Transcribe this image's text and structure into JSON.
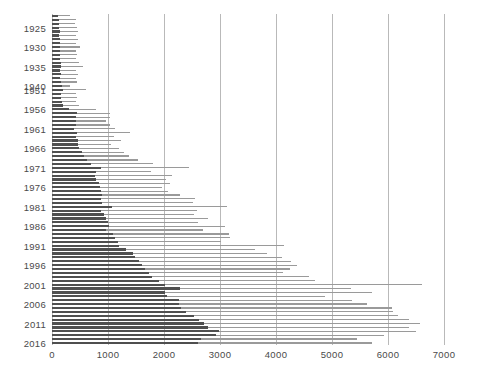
{
  "chart_data": {
    "type": "bar",
    "orientation": "horizontal",
    "title": "",
    "subtitle": "",
    "xlabel": "",
    "ylabel": "",
    "xlim": [
      0,
      7000
    ],
    "ylim_categories": "years 1922-2016 (war years 1941-1950 omitted)",
    "xticks": [
      0,
      1000,
      2000,
      3000,
      4000,
      5000,
      6000,
      7000
    ],
    "xtick_labels": [
      "0",
      "1000",
      "2000",
      "3000",
      "4000",
      "5000",
      "6000",
      "7000"
    ],
    "ytick_labels": [
      "1925",
      "1930",
      "1935",
      "1940",
      "1951",
      "1956",
      "1961",
      "1966",
      "1971",
      "1976",
      "1981",
      "1986",
      "1991",
      "1996",
      "2001",
      "2006",
      "2011",
      "2016"
    ],
    "grid": "vertical-only",
    "legend": "none",
    "colors": {
      "dark_series": "#4f4f4f",
      "light_series": "#9a9a9a",
      "gridline": "#b9b9b9",
      "label_text": "#4a4a4a",
      "background": "#ffffff"
    },
    "series": [
      {
        "name": "dark",
        "color": "#4f4f4f"
      },
      {
        "name": "light",
        "color": "#9a9a9a"
      }
    ],
    "categories": [
      "1922",
      "1923",
      "1924",
      "1925",
      "1926",
      "1927",
      "1928",
      "1929",
      "1930",
      "1931",
      "1932",
      "1933",
      "1934",
      "1935",
      "1936",
      "1937",
      "1938",
      "1939",
      "1940",
      "1951",
      "1952",
      "1953",
      "1954",
      "1955",
      "1956",
      "1957",
      "1958",
      "1959",
      "1960",
      "1961",
      "1962",
      "1963",
      "1964",
      "1965",
      "1966",
      "1967",
      "1968",
      "1969",
      "1970",
      "1971",
      "1972",
      "1973",
      "1974",
      "1975",
      "1976",
      "1977",
      "1978",
      "1979",
      "1980",
      "1981",
      "1982",
      "1983",
      "1984",
      "1985",
      "1986",
      "1987",
      "1988",
      "1989",
      "1990",
      "1991",
      "1992",
      "1993",
      "1994",
      "1995",
      "1996",
      "1997",
      "1998",
      "1999",
      "2000",
      "2001",
      "2002",
      "2003",
      "2004",
      "2005",
      "2006",
      "2007",
      "2008",
      "2009",
      "2010",
      "2011",
      "2012",
      "2013",
      "2014",
      "2015",
      "2016"
    ],
    "rows": [
      {
        "year": "1922",
        "dark": 110,
        "light": 330
      },
      {
        "year": "1923",
        "dark": 120,
        "light": 430
      },
      {
        "year": "1924",
        "dark": 120,
        "light": 410
      },
      {
        "year": "1925",
        "dark": 130,
        "light": 450
      },
      {
        "year": "1926",
        "dark": 140,
        "light": 460
      },
      {
        "year": "1927",
        "dark": 130,
        "light": 420
      },
      {
        "year": "1928",
        "dark": 140,
        "light": 470
      },
      {
        "year": "1929",
        "dark": 150,
        "light": 430
      },
      {
        "year": "1930",
        "dark": 150,
        "light": 500
      },
      {
        "year": "1931",
        "dark": 140,
        "light": 430
      },
      {
        "year": "1932",
        "dark": 150,
        "light": 450
      },
      {
        "year": "1933",
        "dark": 150,
        "light": 420
      },
      {
        "year": "1934",
        "dark": 160,
        "light": 480
      },
      {
        "year": "1935",
        "dark": 160,
        "light": 560
      },
      {
        "year": "1936",
        "dark": 150,
        "light": 430
      },
      {
        "year": "1937",
        "dark": 160,
        "light": 470
      },
      {
        "year": "1938",
        "dark": 150,
        "light": 420
      },
      {
        "year": "1939",
        "dark": 160,
        "light": 440
      },
      {
        "year": "1940",
        "dark": 170,
        "light": 330
      },
      {
        "year": "1951",
        "dark": 200,
        "light": 610
      },
      {
        "year": "1952",
        "dark": 160,
        "light": 430
      },
      {
        "year": "1953",
        "dark": 160,
        "light": 450
      },
      {
        "year": "1954",
        "dark": 170,
        "light": 420
      },
      {
        "year": "1955",
        "dark": 190,
        "light": 480
      },
      {
        "year": "1956",
        "dark": 300,
        "light": 780
      },
      {
        "year": "1957",
        "dark": 450,
        "light": 1040
      },
      {
        "year": "1958",
        "dark": 430,
        "light": 1030
      },
      {
        "year": "1959",
        "dark": 430,
        "light": 960
      },
      {
        "year": "1960",
        "dark": 430,
        "light": 1030
      },
      {
        "year": "1961",
        "dark": 400,
        "light": 1130
      },
      {
        "year": "1962",
        "dark": 440,
        "light": 1390
      },
      {
        "year": "1963",
        "dark": 430,
        "light": 1110
      },
      {
        "year": "1964",
        "dark": 470,
        "light": 1240
      },
      {
        "year": "1965",
        "dark": 470,
        "light": 1060
      },
      {
        "year": "1966",
        "dark": 490,
        "light": 1200
      },
      {
        "year": "1967",
        "dark": 530,
        "light": 1280
      },
      {
        "year": "1968",
        "dark": 570,
        "light": 1380
      },
      {
        "year": "1969",
        "dark": 620,
        "light": 1540
      },
      {
        "year": "1970",
        "dark": 700,
        "light": 1810
      },
      {
        "year": "1971",
        "dark": 870,
        "light": 2450
      },
      {
        "year": "1972",
        "dark": 790,
        "light": 1760
      },
      {
        "year": "1973",
        "dark": 760,
        "light": 2150
      },
      {
        "year": "1974",
        "dark": 790,
        "light": 2040
      },
      {
        "year": "1975",
        "dark": 840,
        "light": 2100
      },
      {
        "year": "1976",
        "dark": 860,
        "light": 1970
      },
      {
        "year": "1977",
        "dark": 880,
        "light": 2080
      },
      {
        "year": "1978",
        "dark": 900,
        "light": 2280
      },
      {
        "year": "1979",
        "dark": 880,
        "light": 2560
      },
      {
        "year": "1980",
        "dark": 900,
        "light": 2520
      },
      {
        "year": "1981",
        "dark": 1080,
        "light": 3130
      },
      {
        "year": "1982",
        "dark": 880,
        "light": 2590
      },
      {
        "year": "1983",
        "dark": 930,
        "light": 2540
      },
      {
        "year": "1984",
        "dark": 970,
        "light": 2790
      },
      {
        "year": "1985",
        "dark": 1000,
        "light": 2610
      },
      {
        "year": "1986",
        "dark": 1020,
        "light": 3090
      },
      {
        "year": "1987",
        "dark": 960,
        "light": 2700
      },
      {
        "year": "1988",
        "dark": 1090,
        "light": 3160
      },
      {
        "year": "1989",
        "dark": 1120,
        "light": 3180
      },
      {
        "year": "1990",
        "dark": 1170,
        "light": 3020
      },
      {
        "year": "1991",
        "dark": 1200,
        "light": 4140
      },
      {
        "year": "1992",
        "dark": 1330,
        "light": 3630
      },
      {
        "year": "1993",
        "dark": 1450,
        "light": 3840
      },
      {
        "year": "1994",
        "dark": 1480,
        "light": 4100
      },
      {
        "year": "1995",
        "dark": 1550,
        "light": 4270
      },
      {
        "year": "1996",
        "dark": 1610,
        "light": 4370
      },
      {
        "year": "1997",
        "dark": 1660,
        "light": 4250
      },
      {
        "year": "1998",
        "dark": 1730,
        "light": 4120
      },
      {
        "year": "1999",
        "dark": 1780,
        "light": 4590
      },
      {
        "year": "2000",
        "dark": 1910,
        "light": 4690
      },
      {
        "year": "2001",
        "dark": 2010,
        "light": 6600
      },
      {
        "year": "2002",
        "dark": 2290,
        "light": 5340
      },
      {
        "year": "2003",
        "dark": 2010,
        "light": 5720
      },
      {
        "year": "2004",
        "dark": 2050,
        "light": 4870
      },
      {
        "year": "2005",
        "dark": 2260,
        "light": 5350
      },
      {
        "year": "2006",
        "dark": 2270,
        "light": 5620
      },
      {
        "year": "2007",
        "dark": 2310,
        "light": 6070
      },
      {
        "year": "2008",
        "dark": 2400,
        "light": 6090
      },
      {
        "year": "2009",
        "dark": 2530,
        "light": 6170
      },
      {
        "year": "2010",
        "dark": 2620,
        "light": 6380
      },
      {
        "year": "2011",
        "dark": 2710,
        "light": 6580
      },
      {
        "year": "2012",
        "dark": 2780,
        "light": 6370
      },
      {
        "year": "2013",
        "dark": 2990,
        "light": 6500
      },
      {
        "year": "2014",
        "dark": 2920,
        "light": 5920
      },
      {
        "year": "2015",
        "dark": 2660,
        "light": 5440
      },
      {
        "year": "2016",
        "dark": 2600,
        "light": 5710
      }
    ],
    "ytick_years": [
      "1925",
      "1930",
      "1935",
      "1940",
      "1951",
      "1956",
      "1961",
      "1966",
      "1971",
      "1976",
      "1981",
      "1986",
      "1991",
      "1996",
      "2001",
      "2006",
      "2011",
      "2016"
    ]
  }
}
